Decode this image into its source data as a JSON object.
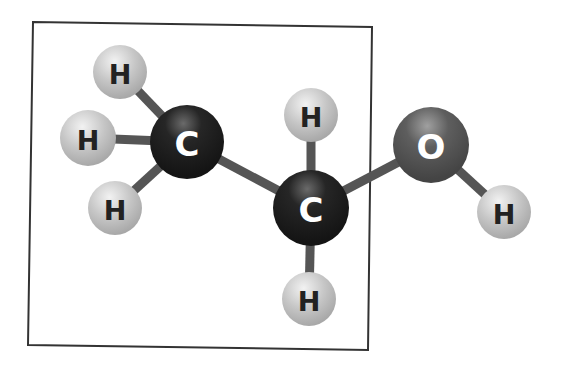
{
  "diagram": {
    "box_label": "highlighted region",
    "atoms": [
      {
        "id": "H1",
        "element": "H",
        "label": "H"
      },
      {
        "id": "H2",
        "element": "H",
        "label": "H"
      },
      {
        "id": "H3",
        "element": "H",
        "label": "H"
      },
      {
        "id": "C1",
        "element": "C",
        "label": "C"
      },
      {
        "id": "H4",
        "element": "H",
        "label": "H"
      },
      {
        "id": "C2",
        "element": "C",
        "label": "C"
      },
      {
        "id": "H5",
        "element": "H",
        "label": "H"
      },
      {
        "id": "O",
        "element": "O",
        "label": "O"
      },
      {
        "id": "H6",
        "element": "H",
        "label": "H"
      }
    ],
    "bonds": [
      [
        "H1",
        "C1"
      ],
      [
        "H2",
        "C1"
      ],
      [
        "H3",
        "C1"
      ],
      [
        "C1",
        "C2"
      ],
      [
        "H4",
        "C2"
      ],
      [
        "H5",
        "C2"
      ],
      [
        "C2",
        "O"
      ],
      [
        "O",
        "H6"
      ]
    ],
    "colors": {
      "hydrogen": "#c4c4c4",
      "carbon": "#1c1c1c",
      "oxygen": "#5a5a5a",
      "bond": "#555555",
      "box": "#333333",
      "h_text": "#222222",
      "c_text": "#ffffff",
      "o_text": "#ffffff"
    }
  }
}
